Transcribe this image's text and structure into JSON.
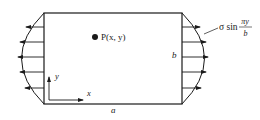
{
  "diagram": {
    "type": "plate-with-sinusoidal-edge-load",
    "plate": {
      "x0": 44,
      "y0": 13,
      "x1": 182,
      "y1": 104
    },
    "point": {
      "label": "P(x, y)",
      "cx": 95,
      "cy": 37
    },
    "labels": {
      "width": "a",
      "height": "b",
      "x_axis": "x",
      "y_axis": "y",
      "load_prefix": "σ sin",
      "load_num": "πy",
      "load_den": "b"
    },
    "load_arrows": {
      "count": 5,
      "left_direction": "outward-left",
      "right_direction": "outward-right"
    },
    "colors": {
      "line": "#1a1a1a",
      "background": "#ffffff"
    }
  }
}
